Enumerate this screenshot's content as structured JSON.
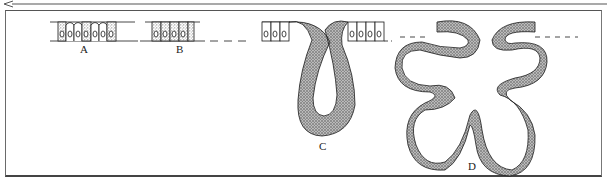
{
  "figure": {
    "panels": [
      {
        "id": "A",
        "label": "A",
        "description": "simple epithelium, alternating stippled and clear cells"
      },
      {
        "id": "B",
        "label": "B",
        "description": "epithelium with mostly stippled (secretory) cells"
      },
      {
        "id": "C",
        "label": "C",
        "description": "simple tubular invagination of epithelium"
      },
      {
        "id": "D",
        "label": "D",
        "description": "branched (compound) tubular gland with multiple lobes"
      }
    ]
  },
  "colors": {
    "line": "#1a1a1a",
    "stipple": "#8a8a8a",
    "frame": "#555555",
    "background": "#ffffff"
  }
}
